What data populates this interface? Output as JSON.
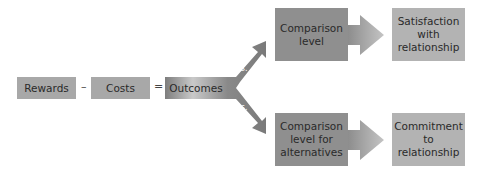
{
  "diagram": {
    "inputs": {
      "rewards": "Rewards",
      "minus": "–",
      "costs": "Costs",
      "equals": "=",
      "outcomes": "Outcomes"
    },
    "branches": [
      {
        "vs_label": "vs.",
        "comparison": "Comparison level",
        "comparison_lines": [
          "Comparison",
          "level"
        ],
        "result_lines": [
          "Satisfaction",
          "with",
          "relationship"
        ]
      },
      {
        "vs_label": "vs.",
        "comparison": "Comparison level for alternatives",
        "comparison_lines": [
          "Comparison",
          "level for",
          "alternatives"
        ],
        "result_lines": [
          "Commitment",
          "to",
          "relationship"
        ]
      }
    ],
    "colors": {
      "small_box": "#a8a8a8",
      "comparison_box": "#8f8f8f",
      "result_box": "#b3b3b3",
      "arrow": "#8c8c8c"
    }
  }
}
